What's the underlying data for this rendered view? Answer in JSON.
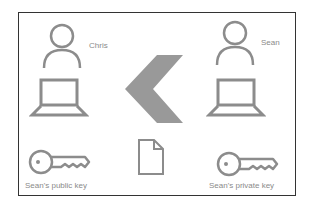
{
  "diagram": {
    "left_party": {
      "name": "Chris",
      "key_label": "Sean's public key"
    },
    "right_party": {
      "name": "Sean",
      "key_label": "Sean's private key"
    },
    "center": {
      "arrow_direction": "left",
      "document_icon": "document-icon"
    },
    "colors": {
      "icon_stroke": "#8c8c8c",
      "arrow_fill": "#999999",
      "border": "#333333",
      "text": "#8a8a8a"
    }
  }
}
